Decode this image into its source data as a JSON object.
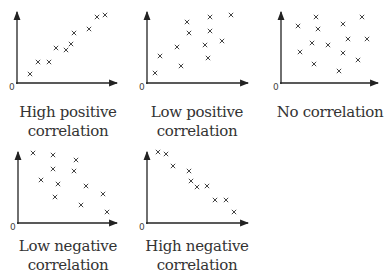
{
  "chart_data": [
    {
      "type": "scatter",
      "title": "High positive correlation",
      "caption_lines": [
        "High positive",
        "correlation"
      ],
      "origin_label": "0",
      "marker": "×",
      "points": [
        [
          30,
          74
        ],
        [
          38,
          62
        ],
        [
          49,
          62
        ],
        [
          56,
          48
        ],
        [
          66,
          50
        ],
        [
          71,
          44
        ],
        [
          74,
          33
        ],
        [
          89,
          29
        ],
        [
          97,
          17
        ],
        [
          105,
          15
        ]
      ],
      "axis": {
        "x0": 17,
        "y0": 83,
        "xend": 117,
        "ytop": 12
      }
    },
    {
      "type": "scatter",
      "title": "Low positive correlation",
      "caption_lines": [
        "Low positive",
        "correlation"
      ],
      "origin_label": "0",
      "marker": "×",
      "points": [
        [
          155,
          73
        ],
        [
          160,
          56
        ],
        [
          181,
          66
        ],
        [
          177,
          47
        ],
        [
          187,
          22
        ],
        [
          189,
          33
        ],
        [
          210,
          17
        ],
        [
          210,
          31
        ],
        [
          205,
          45
        ],
        [
          208,
          58
        ],
        [
          222,
          41
        ],
        [
          231,
          15
        ]
      ],
      "axis": {
        "x0": 147,
        "y0": 83,
        "xend": 248,
        "ytop": 12
      }
    },
    {
      "type": "scatter",
      "title": "No correlation",
      "caption_lines": [
        "No correlation"
      ],
      "origin_label": "0",
      "marker": "×",
      "points": [
        [
          298,
          26
        ],
        [
          316,
          17
        ],
        [
          318,
          29
        ],
        [
          312,
          43
        ],
        [
          300,
          52
        ],
        [
          314,
          64
        ],
        [
          328,
          45
        ],
        [
          343,
          24
        ],
        [
          348,
          39
        ],
        [
          343,
          53
        ],
        [
          339,
          71
        ],
        [
          362,
          17
        ],
        [
          367,
          39
        ],
        [
          358,
          60
        ]
      ],
      "axis": {
        "x0": 281,
        "y0": 83,
        "xend": 378,
        "ytop": 12
      }
    },
    {
      "type": "scatter",
      "title": "Low negative correlation",
      "caption_lines": [
        "Low negative",
        "correlation"
      ],
      "origin_label": "0",
      "marker": "×",
      "points": [
        [
          33,
          153
        ],
        [
          53,
          155
        ],
        [
          76,
          160
        ],
        [
          53,
          169
        ],
        [
          74,
          171
        ],
        [
          41,
          180
        ],
        [
          58,
          184
        ],
        [
          86,
          186
        ],
        [
          55,
          197
        ],
        [
          103,
          194
        ],
        [
          81,
          205
        ],
        [
          107,
          212
        ]
      ],
      "axis": {
        "x0": 18,
        "y0": 223,
        "xend": 117,
        "ytop": 152
      }
    },
    {
      "type": "scatter",
      "title": "High negative correlation",
      "caption_lines": [
        "High negative",
        "correlation"
      ],
      "origin_label": "0",
      "marker": "×",
      "points": [
        [
          158,
          152
        ],
        [
          166,
          154
        ],
        [
          173,
          166
        ],
        [
          189,
          171
        ],
        [
          191,
          181
        ],
        [
          197,
          187
        ],
        [
          207,
          186
        ],
        [
          215,
          200
        ],
        [
          226,
          200
        ],
        [
          234,
          212
        ]
      ],
      "axis": {
        "x0": 147,
        "y0": 223,
        "xend": 248,
        "ytop": 152
      }
    }
  ],
  "captions": {
    "p1": {
      "l1": "High positive",
      "l2": "correlation"
    },
    "p2": {
      "l1": "Low positive",
      "l2": "correlation"
    },
    "p3": {
      "l1": "No correlation"
    },
    "p4": {
      "l1": "Low negative",
      "l2": "correlation"
    },
    "p5": {
      "l1": "High negative",
      "l2": "correlation"
    }
  },
  "origin_label": "0"
}
